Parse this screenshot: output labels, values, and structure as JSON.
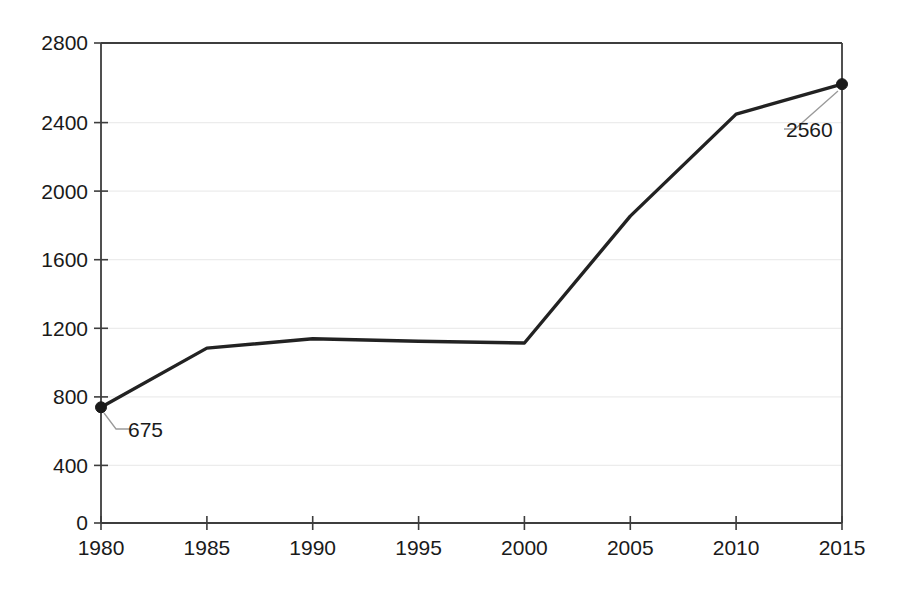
{
  "chart_data": {
    "type": "line",
    "title": "",
    "subtitle": "",
    "xlabel": "",
    "ylabel": "",
    "x": [
      1980,
      1985,
      1990,
      1995,
      2000,
      2005,
      2010,
      2015
    ],
    "categories": [
      "1980",
      "1985",
      "1990",
      "1995",
      "2000",
      "2005",
      "2010",
      "2015"
    ],
    "values": [
      675,
      1020,
      1075,
      1060,
      1050,
      1790,
      2385,
      2560
    ],
    "series": [
      {
        "name": "",
        "values": [
          675,
          1020,
          1075,
          1060,
          1050,
          1790,
          2385,
          2560
        ]
      }
    ],
    "xlim": [
      1980,
      2015
    ],
    "ylim": [
      0,
      2800
    ],
    "y_ticks": [
      0,
      400,
      800,
      1200,
      1600,
      2000,
      2400,
      2800
    ],
    "y_tick_labels": [
      "0",
      "400",
      "800",
      "1200",
      "1600",
      "2000",
      "2400",
      "2800"
    ],
    "x_ticks": [
      1980,
      1985,
      1990,
      1995,
      2000,
      2005,
      2010,
      2015
    ],
    "x_tick_labels": [
      "1980",
      "1985",
      "1990",
      "1995",
      "2000",
      "2005",
      "2010",
      "2015"
    ],
    "grid": true,
    "grid_axis": "y",
    "legend": false,
    "legend_position": "none",
    "annotations": [
      {
        "text": "675",
        "x": 1980,
        "y": 675,
        "label_x": 1980,
        "label_y": 675
      },
      {
        "text": "2560",
        "x": 2015,
        "y": 2560,
        "label_x": 2015,
        "label_y": 2560
      }
    ],
    "colors": {
      "line": "#222222",
      "marker": "#1a1a1a",
      "grid": "#ececec",
      "axis": "#3d3d3d",
      "leader": "#9a9a9a",
      "background": "#ffffff",
      "text": "#1a1a1a"
    }
  },
  "axes": {
    "y_labels": [
      "2800",
      "2400",
      "2000",
      "1600",
      "1200",
      "800",
      "400",
      "0"
    ],
    "x_labels": [
      "1980",
      "1985",
      "1990",
      "1995",
      "2000",
      "2005",
      "2010",
      "2015"
    ]
  },
  "labels": {
    "first_point": "675",
    "last_point": "2560"
  }
}
